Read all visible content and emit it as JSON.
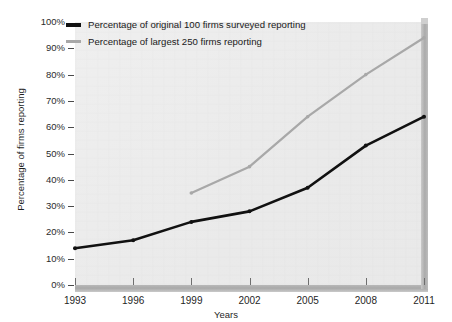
{
  "chart_data": {
    "type": "line",
    "title": "",
    "xlabel": "Years",
    "ylabel": "Percentage of firms reporting",
    "categories": [
      "1993",
      "1996",
      "1999",
      "2002",
      "2005",
      "2008",
      "2011"
    ],
    "x": [
      1993,
      1996,
      1999,
      2002,
      2005,
      2008,
      2011
    ],
    "xlim": [
      1993,
      2011
    ],
    "ylim": [
      0,
      100
    ],
    "ytick_labels": [
      "0%",
      "10%",
      "20%",
      "30%",
      "40%",
      "50%",
      "60%",
      "70%",
      "80%",
      "90%",
      "100%"
    ],
    "ytick_values": [
      0,
      10,
      20,
      30,
      40,
      50,
      60,
      70,
      80,
      90,
      100
    ],
    "grid": false,
    "legend_position": "top-left",
    "series": [
      {
        "name": "Percentage of original 100 firms surveyed reporting",
        "color": "#111111",
        "line_width": 2.6,
        "markers": true,
        "x": [
          1993,
          1996,
          1999,
          2002,
          2005,
          2008,
          2011
        ],
        "values": [
          14,
          17,
          24,
          28,
          37,
          53,
          64
        ]
      },
      {
        "name": "Percentage of largest 250 firms reporting",
        "color": "#a8a8a8",
        "line_width": 2.2,
        "markers": true,
        "x": [
          1999,
          2002,
          2005,
          2008,
          2011
        ],
        "values": [
          35,
          45,
          64,
          80,
          94
        ]
      }
    ]
  },
  "legend": {
    "items": [
      {
        "label": "Percentage of original 100 firms surveyed reporting",
        "color": "#111111"
      },
      {
        "label": "Percentage of largest 250 firms reporting",
        "color": "#a8a8a8"
      }
    ]
  },
  "axes": {
    "x_title": "Years",
    "y_title": "Percentage of firms reporting",
    "x_labels": [
      "1993",
      "1996",
      "1999",
      "2002",
      "2005",
      "2008",
      "2011"
    ],
    "y_labels": [
      "100%",
      "90%",
      "80%",
      "70%",
      "60%",
      "50%",
      "40%",
      "30%",
      "20%",
      "10%",
      "0%"
    ]
  },
  "colors": {
    "plot_background": "#eeeeee",
    "axis_bar": "#aaaaaa",
    "series_primary": "#111111",
    "series_secondary": "#a8a8a8",
    "text": "#1f1f1f"
  }
}
